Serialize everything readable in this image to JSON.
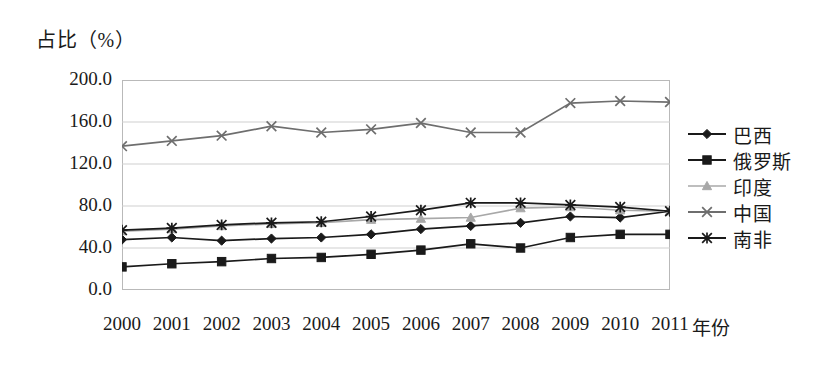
{
  "figure": {
    "yaxis_title": "占比（%）",
    "xaxis_title": "年份"
  },
  "legend": {
    "position": "right",
    "items": [
      {
        "label": "巴西",
        "marker": "diamond-icon",
        "color": "#1a1a1a"
      },
      {
        "label": "俄罗斯",
        "marker": "square-icon",
        "color": "#1a1a1a"
      },
      {
        "label": "印度",
        "marker": "triangle-icon",
        "color": "#a8a8a8"
      },
      {
        "label": "中国",
        "marker": "x-icon",
        "color": "#6e6e6e"
      },
      {
        "label": "南非",
        "marker": "asterisk-icon",
        "color": "#1a1a1a"
      }
    ]
  },
  "chart_data": {
    "type": "line",
    "title": "",
    "subtitle": "",
    "xlabel": "年份",
    "ylabel": "占比（%）",
    "grid": true,
    "legend_position": "right",
    "categories": [
      "2000",
      "2001",
      "2002",
      "2003",
      "2004",
      "2005",
      "2006",
      "2007",
      "2008",
      "2009",
      "2010",
      "2011"
    ],
    "x": [
      2000,
      2001,
      2002,
      2003,
      2004,
      2005,
      2006,
      2007,
      2008,
      2009,
      2010,
      2011
    ],
    "xlim": [
      2000,
      2011
    ],
    "ylim": [
      0,
      200
    ],
    "yticks": [
      0.0,
      40.0,
      80.0,
      120.0,
      160.0,
      200.0
    ],
    "ytick_labels": [
      "0.0",
      "40.0",
      "80.0",
      "120.0",
      "160.0",
      "200.0"
    ],
    "series": [
      {
        "name": "巴西",
        "marker": "diamond",
        "color": "#1a1a1a",
        "values": [
          48,
          50,
          47,
          49,
          50,
          53,
          58,
          61,
          64,
          70,
          69,
          75
        ]
      },
      {
        "name": "俄罗斯",
        "marker": "square",
        "color": "#1a1a1a",
        "values": [
          22,
          25,
          27,
          30,
          31,
          34,
          38,
          44,
          40,
          50,
          53,
          53
        ]
      },
      {
        "name": "印度",
        "marker": "triangle",
        "color": "#a8a8a8",
        "values": [
          56,
          58,
          61,
          63,
          64,
          67,
          68,
          69,
          78,
          79,
          76,
          75
        ]
      },
      {
        "name": "中国",
        "marker": "x",
        "color": "#6e6e6e",
        "values": [
          137,
          142,
          147,
          156,
          150,
          153,
          159,
          150,
          150,
          178,
          180,
          179
        ]
      },
      {
        "name": "南非",
        "marker": "asterisk",
        "color": "#1a1a1a",
        "values": [
          57,
          59,
          62,
          64,
          65,
          70,
          76,
          83,
          83,
          81,
          79,
          75
        ]
      }
    ]
  }
}
